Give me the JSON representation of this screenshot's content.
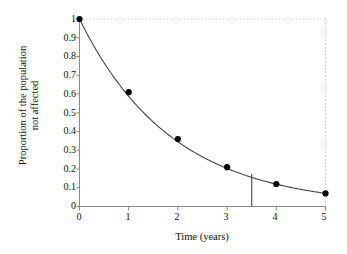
{
  "chart_data": {
    "type": "line",
    "title": "",
    "subtitle": "",
    "xlabel": "Time (years)",
    "ylabel_line1": "Proportion of the population",
    "ylabel_line2": "not affected",
    "x": [
      0,
      1,
      2,
      3,
      4,
      5
    ],
    "values": [
      1,
      0.61,
      0.36,
      0.21,
      0.12,
      0.07
    ],
    "series": [
      {
        "name": "Proportion not affected",
        "values": [
          1,
          0.61,
          0.36,
          0.21,
          0.12,
          0.07
        ]
      }
    ],
    "xlim": [
      0,
      5
    ],
    "ylim": [
      0,
      1
    ],
    "xticks": [
      0,
      1,
      2,
      3,
      4,
      5
    ],
    "xtick_labels": [
      "0",
      "1",
      "2",
      "3",
      "4",
      "5"
    ],
    "yticks": [
      0,
      0.1,
      0.2,
      0.3,
      0.4,
      0.5,
      0.6,
      0.7,
      0.8,
      0.9,
      1
    ],
    "ytick_labels": [
      "0",
      "0.1",
      "0.2",
      "0.3",
      "0.4",
      "0.5",
      "0.6",
      "0.7",
      "0.8",
      "0.9",
      "1"
    ],
    "grid": false,
    "legend": "none",
    "annotations": [
      {
        "name": "vertical-reference-line",
        "x": 3.5,
        "y_from": 0,
        "y_to": 0.1738
      }
    ],
    "marker": "filled-circle",
    "line_color": "#444444",
    "marker_color": "#000000",
    "axis_color": "#888888",
    "dotted_border_color": "#cccccc",
    "background": "#ffffff"
  }
}
